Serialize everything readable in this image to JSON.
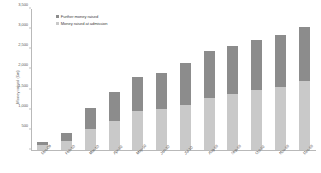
{
  "chart_data": {
    "type": "bar",
    "stacked": true,
    "title": "",
    "xlabel": "",
    "ylabel": "Money raised (£m)",
    "ylim": [
      0,
      3500
    ],
    "ytick_values": [
      0,
      500,
      1000,
      1500,
      2000,
      2500,
      3000,
      3500
    ],
    "ytick_labels": [
      "",
      "500",
      "1,000",
      "1,500",
      "2,000",
      "2,500",
      "3,000",
      "3,500"
    ],
    "grid": false,
    "legend_position": "top-left",
    "categories": [
      "Dec-09",
      "Feb-10",
      "Mar-10",
      "Apr-10",
      "May-10",
      "Jun-10",
      "Jul-10",
      "Aug-10",
      "Sep-10",
      "Oct-10",
      "Nov-10",
      "Dec-10"
    ],
    "series": [
      {
        "name": "Money raised at admission",
        "color": "#c9c9c9",
        "values": [
          130,
          230,
          510,
          710,
          960,
          1010,
          1120,
          1300,
          1390,
          1500,
          1570,
          1710
        ]
      },
      {
        "name": "Further money raised",
        "color": "#8c8c8c",
        "values": [
          70,
          180,
          540,
          730,
          850,
          900,
          1050,
          1150,
          1200,
          1230,
          1290,
          1340
        ]
      }
    ],
    "totals": [
      200,
      410,
      1050,
      1440,
      1810,
      1910,
      2170,
      2450,
      2590,
      2730,
      2860,
      3050
    ]
  },
  "legend": {
    "items": [
      {
        "label": "Further money raised",
        "color": "#8c8c8c"
      },
      {
        "label": "Money raised at admission",
        "color": "#c9c9c9"
      }
    ]
  }
}
